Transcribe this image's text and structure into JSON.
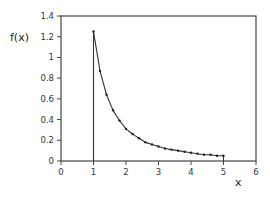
{
  "chart_data": {
    "type": "line",
    "title": "",
    "xlabel": "x",
    "ylabel": "f(x)",
    "xlim": [
      0,
      6
    ],
    "ylim": [
      0,
      1.4
    ],
    "x_ticks": [
      "0",
      "1",
      "2",
      "3",
      "4",
      "5",
      "6"
    ],
    "y_ticks": [
      "0",
      "0.2",
      "0.4",
      "0.6",
      "0.8",
      "1",
      "1.2",
      "1.4"
    ],
    "grid": false,
    "legend": null,
    "annotations": [
      "vertical line at x=1 from 0 to f(1)",
      "short vertical line at x=5 down to 0"
    ],
    "series": [
      {
        "name": "f(x)",
        "marker": "dot",
        "x": [
          1.0,
          1.2,
          1.4,
          1.6,
          1.8,
          2.0,
          2.2,
          2.4,
          2.6,
          2.8,
          3.0,
          3.2,
          3.4,
          3.6,
          3.8,
          4.0,
          4.2,
          4.4,
          4.6,
          4.8,
          5.0
        ],
        "values": [
          1.25,
          0.87,
          0.64,
          0.49,
          0.39,
          0.31,
          0.26,
          0.22,
          0.18,
          0.16,
          0.14,
          0.12,
          0.11,
          0.1,
          0.09,
          0.08,
          0.07,
          0.06,
          0.06,
          0.05,
          0.05
        ]
      }
    ]
  },
  "colors": {
    "axis": "#444444",
    "line": "#333333",
    "marker": "#222222"
  }
}
